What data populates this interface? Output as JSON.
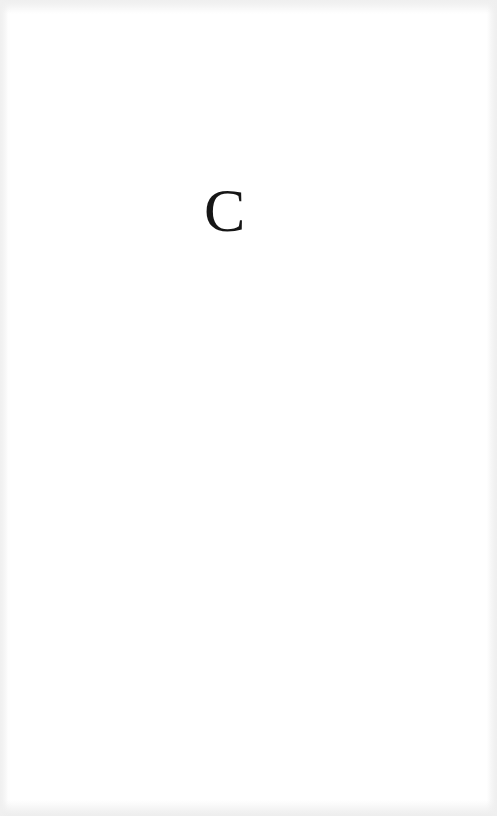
{
  "page": {
    "content": {
      "letter": "C"
    },
    "colors": {
      "background": "#ffffff",
      "text": "#161616",
      "scan_edge": "#efefef"
    }
  }
}
